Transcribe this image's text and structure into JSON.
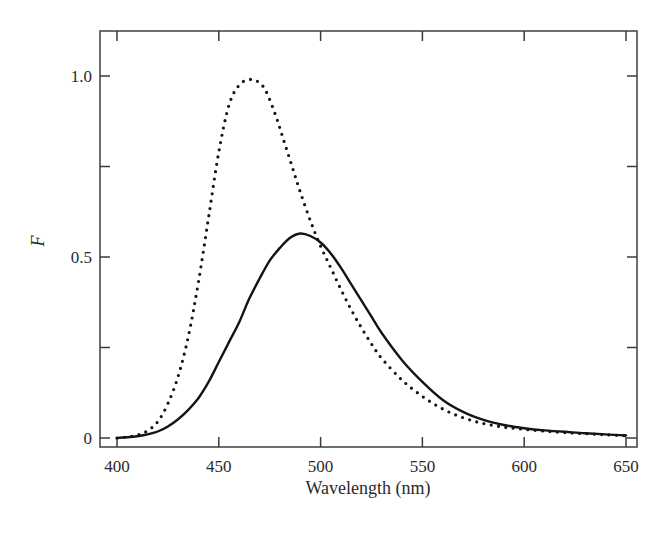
{
  "chart_data": {
    "type": "line",
    "title": "",
    "xlabel": "Wavelength (nm)",
    "ylabel": "F",
    "xlim": [
      391,
      656
    ],
    "ylim": [
      -0.025,
      1.12
    ],
    "grid": false,
    "legend": null,
    "x_ticks": [
      400,
      450,
      500,
      550,
      600,
      650
    ],
    "x_tick_labels": [
      "400",
      "450",
      "500",
      "550",
      "600",
      "650"
    ],
    "y_ticks": [
      0,
      0.25,
      0.5,
      0.75,
      1.0
    ],
    "y_tick_labels": [
      "0",
      "",
      "0.5",
      "",
      "1.0"
    ],
    "series": [
      {
        "name": "dotted",
        "style": "dotted",
        "x": [
          400,
          405,
          410,
          415,
          420,
          425,
          430,
          435,
          440,
          445,
          450,
          455,
          460,
          465,
          469,
          473,
          478,
          482,
          486,
          490,
          495,
          500,
          505,
          510,
          515,
          520,
          525,
          530,
          540,
          550,
          560,
          570,
          580,
          590,
          600,
          610,
          620,
          630,
          640,
          650
        ],
        "values": [
          0.0,
          0.003,
          0.008,
          0.02,
          0.045,
          0.095,
          0.17,
          0.28,
          0.43,
          0.61,
          0.79,
          0.92,
          0.975,
          0.99,
          0.985,
          0.96,
          0.89,
          0.82,
          0.75,
          0.68,
          0.6,
          0.53,
          0.47,
          0.41,
          0.355,
          0.305,
          0.26,
          0.22,
          0.16,
          0.115,
          0.08,
          0.056,
          0.04,
          0.03,
          0.024,
          0.019,
          0.015,
          0.012,
          0.009,
          0.006
        ]
      },
      {
        "name": "solid",
        "style": "solid",
        "x": [
          400,
          405,
          410,
          415,
          420,
          425,
          430,
          435,
          440,
          445,
          450,
          455,
          460,
          465,
          470,
          475,
          480,
          485,
          490,
          495,
          500,
          505,
          510,
          515,
          520,
          525,
          530,
          540,
          550,
          560,
          570,
          580,
          590,
          600,
          610,
          620,
          630,
          640,
          650
        ],
        "values": [
          0.0,
          0.002,
          0.005,
          0.01,
          0.018,
          0.032,
          0.052,
          0.078,
          0.11,
          0.155,
          0.21,
          0.265,
          0.32,
          0.385,
          0.44,
          0.49,
          0.525,
          0.553,
          0.565,
          0.558,
          0.54,
          0.51,
          0.47,
          0.425,
          0.38,
          0.335,
          0.29,
          0.215,
          0.155,
          0.105,
          0.072,
          0.05,
          0.036,
          0.027,
          0.021,
          0.017,
          0.013,
          0.01,
          0.007
        ]
      }
    ]
  },
  "layout": {
    "plot_px": {
      "left": 100,
      "top": 31,
      "right": 637,
      "bottom": 447
    },
    "x_px_at_400": 117,
    "x_px_at_650": 626,
    "y_px_at_0": 438,
    "y_px_at_1": 76
  }
}
